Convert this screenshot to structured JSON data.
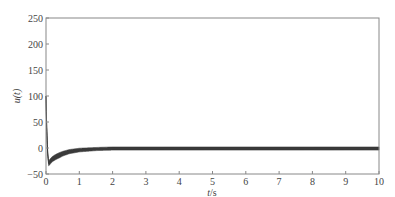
{
  "chart_data": {
    "type": "line",
    "title": "",
    "xlabel": "t/s",
    "ylabel": "u(t)",
    "xlim": [
      0,
      10
    ],
    "ylim": [
      -50,
      250
    ],
    "x_ticks": [
      0,
      1,
      2,
      3,
      4,
      5,
      6,
      7,
      8,
      9,
      10
    ],
    "y_ticks": [
      -50,
      0,
      50,
      100,
      150,
      200,
      250
    ],
    "grid": false,
    "legend": null,
    "series": [
      {
        "name": "u(t)",
        "style": "thick dark oscillating band (high-frequency chattering)",
        "x": [
          0,
          0.02,
          0.05,
          0.08,
          0.1,
          0.15,
          0.2,
          0.3,
          0.4,
          0.5,
          0.7,
          1.0,
          1.5,
          2.0,
          3.0,
          4.0,
          5.0,
          6.0,
          7.0,
          8.0,
          9.0,
          10.0
        ],
        "y": [
          100,
          40,
          -10,
          -30,
          -28,
          -24,
          -21,
          -17,
          -14,
          -11,
          -7,
          -4,
          -2,
          -1,
          -1,
          -1,
          -1,
          -1,
          -1,
          -1,
          -1,
          -1
        ],
        "band_halfwidth": [
          0,
          1,
          2,
          4,
          5,
          5,
          5,
          5,
          5,
          4.5,
          4,
          3.5,
          3,
          3,
          3,
          3,
          3,
          3,
          3,
          3,
          3,
          3
        ]
      }
    ]
  },
  "colors": {
    "curve": "#3a3a3a",
    "axis": "#777777",
    "text": "#444444"
  },
  "labels": {
    "xlabel_italic": "t",
    "xlabel_unit": "/s",
    "ylabel": "u(t)"
  }
}
